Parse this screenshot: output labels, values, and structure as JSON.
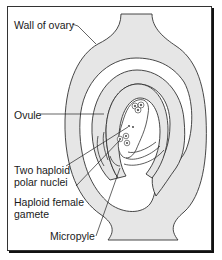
{
  "diagram": {
    "labels": {
      "wall_of_ovary": "Wall of ovary",
      "ovule": "Ovule",
      "polar_nuclei_line1": "Two haploid",
      "polar_nuclei_line2": "polar nuclei",
      "female_gamete_line1": "Haploid female",
      "female_gamete_line2": "gamete",
      "micropyle": "Micropyle"
    },
    "colors": {
      "tissue_fill": "#e6e6e6",
      "outline": "#333333",
      "background": "#ffffff",
      "frame": "#333333"
    }
  }
}
